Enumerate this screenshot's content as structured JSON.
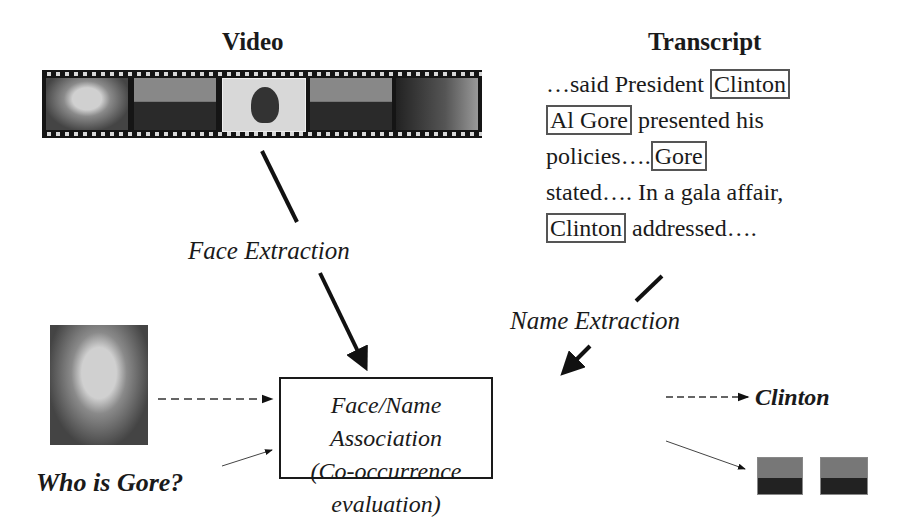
{
  "video": {
    "title": "Video",
    "frames": [
      "clinton-frame",
      "gore-frame",
      "woman-frame",
      "gore-frame-2",
      "clinton-frame-2"
    ]
  },
  "transcript": {
    "title": "Transcript",
    "lines": [
      {
        "pre": "…said President ",
        "name": "Clinton",
        "post": ""
      },
      {
        "pre": "",
        "name": "Al Gore",
        "post": " presented his"
      },
      {
        "pre": "policies….",
        "name": "Gore",
        "post": ""
      },
      {
        "pre": "stated…. In a gala affair,",
        "name": "",
        "post": ""
      },
      {
        "pre": "",
        "name": "Clinton",
        "post": " addressed…."
      }
    ]
  },
  "labels": {
    "face_extraction": "Face Extraction",
    "name_extraction": "Name Extraction",
    "association_line1": "Face/Name Association",
    "association_line2": "(Co-occurrence evaluation)",
    "query": "Who is Gore?",
    "result_name": "Clinton"
  }
}
